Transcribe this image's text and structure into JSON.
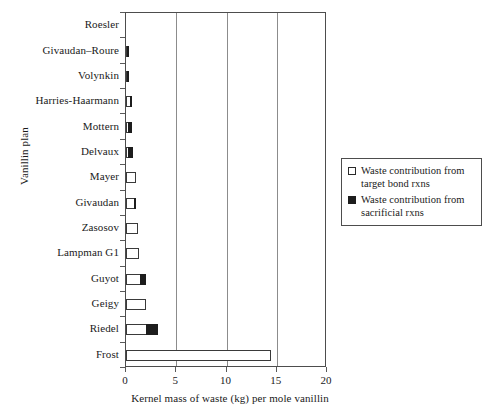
{
  "chart_data": {
    "type": "bar",
    "orientation": "horizontal",
    "title": "",
    "xlabel": "Kernel mass of waste (kg) per mole vanillin",
    "ylabel": "Vanillin plan",
    "xlim": [
      0,
      20
    ],
    "xticks": [
      0,
      5,
      10,
      15,
      20
    ],
    "xtick_labels": [
      "0",
      "5",
      "10",
      "15",
      "20"
    ],
    "grid": "vertical gridlines at 5, 10, 15",
    "legend_position": "right-middle",
    "categories": [
      "Roesler",
      "Givaudan–Roure",
      "Volynkin",
      "Harries-Haarmann",
      "Mottern",
      "Delvaux",
      "Mayer",
      "Givaudan",
      "Zasosov",
      "Lampman G1",
      "Guyot",
      "Geigy",
      "Riedel",
      "Frost"
    ],
    "series": [
      {
        "name": "Waste contribution from target bond rxns",
        "style": "open",
        "color": "#ffffff",
        "edge_color": "#3a3a3a",
        "values": [
          0.0,
          0.2,
          0.2,
          0.55,
          0.35,
          0.3,
          1.0,
          0.9,
          1.15,
          1.3,
          1.55,
          2.0,
          2.1,
          14.4
        ]
      },
      {
        "name": "Waste contribution from sacrificial rxns",
        "style": "filled",
        "color": "#1d1d1d",
        "edge_color": "#1d1d1d",
        "values": [
          0.0,
          0.1,
          0.1,
          0.05,
          0.35,
          0.5,
          0.0,
          0.25,
          0.0,
          0.0,
          0.55,
          0.0,
          1.2,
          0.0
        ]
      }
    ]
  },
  "legend": {
    "entries": [
      {
        "swatch": "open",
        "line1": "Waste contribution from",
        "line2": "target bond rxns"
      },
      {
        "swatch": "filled",
        "line1": "Waste contribution from",
        "line2": "sacrificial rxns"
      }
    ]
  },
  "colors": {
    "axis": "#4d4d4d",
    "grid": "#8c8c8c",
    "open_fill": "#ffffff",
    "filled_fill": "#1d1d1d",
    "background": "#ffffff"
  }
}
